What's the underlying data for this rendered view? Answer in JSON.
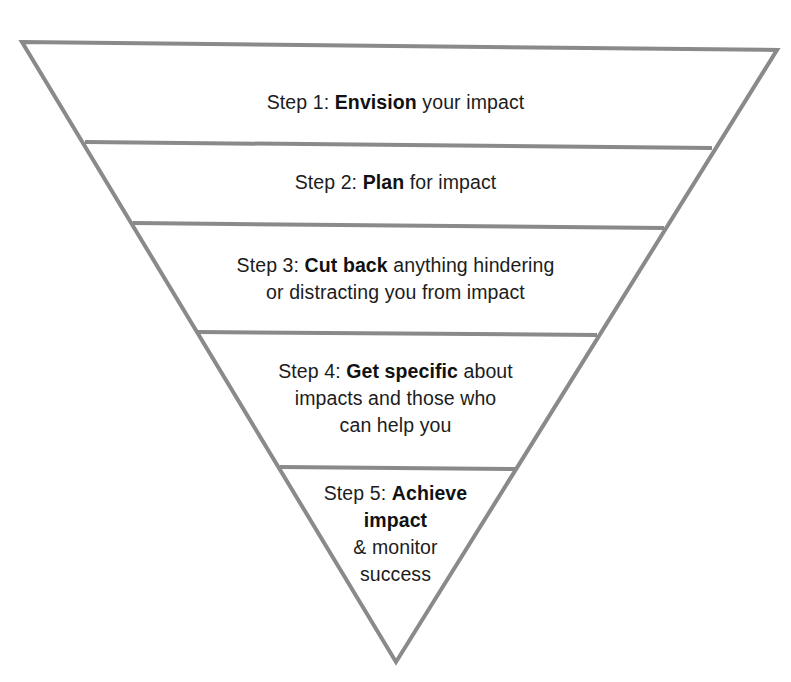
{
  "diagram": {
    "type": "inverted-pyramid",
    "stroke_color": "#8a8a8a",
    "text_color": "#1c1c1c",
    "background": "#ffffff",
    "steps": [
      {
        "number": 1,
        "prefix": "Step 1: ",
        "emphasis": "Envision",
        "suffix": " your impact",
        "lines": [
          {
            "prefix": "Step 1: ",
            "bold": "Envision",
            "rest": " your impact"
          }
        ]
      },
      {
        "number": 2,
        "prefix": "Step 2: ",
        "emphasis": "Plan",
        "suffix": " for impact",
        "lines": [
          {
            "prefix": "Step 2: ",
            "bold": "Plan",
            "rest": " for impact"
          }
        ]
      },
      {
        "number": 3,
        "prefix": "Step 3: ",
        "emphasis": "Cut back",
        "suffix": " anything hindering or distracting you from impact",
        "lines": [
          {
            "prefix": "Step 3: ",
            "bold": "Cut back",
            "rest": " anything hindering"
          },
          {
            "prefix": "",
            "bold": "",
            "rest": "or distracting you from impact"
          }
        ]
      },
      {
        "number": 4,
        "prefix": "Step 4: ",
        "emphasis": "Get specific",
        "suffix": " about impacts and those who can help you",
        "lines": [
          {
            "prefix": "Step 4: ",
            "bold": "Get specific",
            "rest": " about"
          },
          {
            "prefix": "",
            "bold": "",
            "rest": "impacts and those who"
          },
          {
            "prefix": "",
            "bold": "",
            "rest": "can help you"
          }
        ]
      },
      {
        "number": 5,
        "prefix": "Step 5: ",
        "emphasis": "Achieve impact",
        "suffix": " & monitor success",
        "lines": [
          {
            "prefix": "Step 5: ",
            "bold": "Achieve",
            "rest": ""
          },
          {
            "prefix": "",
            "bold": "impact",
            "rest": ""
          },
          {
            "prefix": "",
            "bold": "",
            "rest": "& monitor"
          },
          {
            "prefix": "",
            "bold": "",
            "rest": "success"
          }
        ]
      }
    ]
  }
}
